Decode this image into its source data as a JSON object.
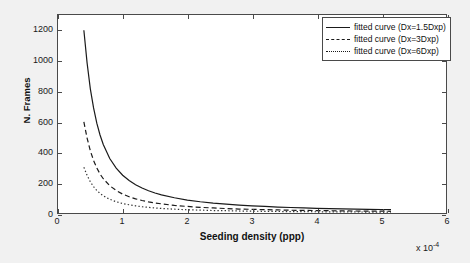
{
  "chart_data": {
    "type": "line",
    "title": "",
    "xlabel": "Seeding density (ppp)",
    "ylabel": "N. Frames",
    "x_exponent_text": "x 10",
    "x_exponent_power": "-4",
    "xlim": [
      0,
      6
    ],
    "ylim": [
      0,
      1300
    ],
    "xticks": [
      0,
      1,
      2,
      3,
      4,
      5,
      6
    ],
    "yticks": [
      0,
      200,
      400,
      600,
      800,
      1000,
      1200
    ],
    "xtick_labels": [
      "0",
      "1",
      "2",
      "3",
      "4",
      "5",
      "6"
    ],
    "ytick_labels": [
      "0",
      "200",
      "400",
      "600",
      "800",
      "1000",
      "1200"
    ],
    "grid": false,
    "legend_position": "upper right",
    "x_units": "1e-4 ppp",
    "series": [
      {
        "name": "fitted curve (Dx=1.5Dxp)",
        "style": "solid",
        "color": "#1a1a1a",
        "x": [
          0.4,
          0.45,
          0.5,
          0.55,
          0.6,
          0.65,
          0.7,
          0.8,
          0.9,
          1.0,
          1.1,
          1.2,
          1.3,
          1.4,
          1.5,
          1.6,
          1.8,
          2.0,
          2.2,
          2.4,
          2.6,
          2.8,
          3.0,
          3.2,
          3.4,
          3.6,
          3.8,
          4.0,
          4.2,
          4.4,
          4.6,
          4.8,
          5.0,
          5.15
        ],
        "y": [
          1200,
          985,
          815,
          690,
          590,
          512,
          450,
          358,
          295,
          248,
          213,
          186,
          164,
          146,
          131,
          119,
          100,
          85,
          74,
          65,
          58,
          52,
          47,
          43,
          39,
          36,
          34,
          31,
          29,
          27,
          26,
          24,
          23,
          22
        ]
      },
      {
        "name": "fitted curve (Dx=3Dxp)",
        "style": "dashed",
        "color": "#1a1a1a",
        "x": [
          0.4,
          0.45,
          0.5,
          0.55,
          0.6,
          0.65,
          0.7,
          0.8,
          0.9,
          1.0,
          1.1,
          1.2,
          1.3,
          1.4,
          1.5,
          1.6,
          1.8,
          2.0,
          2.2,
          2.4,
          2.6,
          2.8,
          3.0,
          3.2,
          3.4,
          3.6,
          3.8,
          4.0,
          4.2,
          4.4,
          4.6,
          4.8,
          5.0,
          5.15
        ],
        "y": [
          598,
          492,
          408,
          345,
          296,
          256,
          225,
          179,
          148,
          124,
          107,
          93,
          82,
          73,
          66,
          60,
          50,
          43,
          37,
          33,
          29,
          26,
          24,
          22,
          20,
          18,
          17,
          16,
          15,
          14,
          13,
          12,
          12,
          11
        ]
      },
      {
        "name": "fitted curve (Dx=6Dxp)",
        "style": "dotted",
        "color": "#333333",
        "x": [
          0.4,
          0.45,
          0.5,
          0.55,
          0.6,
          0.65,
          0.7,
          0.8,
          0.9,
          1.0,
          1.1,
          1.2,
          1.3,
          1.4,
          1.5,
          1.6,
          1.8,
          2.0,
          2.2,
          2.4,
          2.6,
          2.8,
          3.0,
          3.2,
          3.4,
          3.6,
          3.8,
          4.0,
          4.2,
          4.4,
          4.6,
          4.8,
          5.0,
          5.15
        ],
        "y": [
          300,
          247,
          205,
          173,
          148,
          129,
          113,
          90,
          74,
          62,
          54,
          47,
          41,
          37,
          33,
          30,
          25,
          21,
          19,
          16,
          15,
          13,
          12,
          11,
          10,
          9,
          9,
          8,
          7,
          7,
          7,
          6,
          6,
          6
        ]
      }
    ],
    "legend": [
      {
        "label": "fitted curve (Dx=1.5Dxp)",
        "style": "solid"
      },
      {
        "label": "fitted curve (Dx=3Dxp)",
        "style": "dashed"
      },
      {
        "label": "fitted curve (Dx=6Dxp)",
        "style": "dotted"
      }
    ]
  }
}
